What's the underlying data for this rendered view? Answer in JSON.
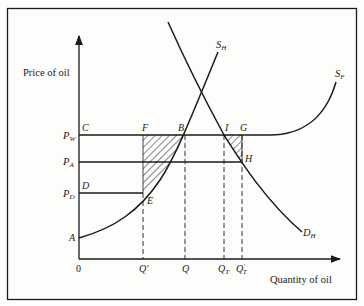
{
  "diagram": {
    "axes": {
      "y_label": "Price of oil",
      "x_label": "Quantity of oil",
      "origin_label": "0"
    },
    "price_levels": {
      "pw": {
        "main": "P",
        "sub": "W"
      },
      "pa": {
        "main": "P",
        "sub": "A"
      },
      "pd": {
        "main": "P",
        "sub": "D"
      }
    },
    "quantity_levels": {
      "q_prime": "Q′",
      "q": "Q",
      "qt": {
        "main": "Q",
        "sub": "T"
      },
      "qt_prime": {
        "main": "Q",
        "sub": "T",
        "prime": "′"
      }
    },
    "points": {
      "a": "A",
      "c": "C",
      "d": "D",
      "e": "E",
      "f": "F",
      "b": "B",
      "i": "I",
      "g": "G",
      "h": "H"
    },
    "curves": {
      "sh": {
        "main": "S",
        "sub": "H"
      },
      "sf": {
        "main": "S",
        "sub": "F"
      },
      "dh": {
        "main": "D",
        "sub": "H"
      }
    },
    "colors": {
      "ink": "#1a1a1a",
      "paper": "#fdfdfb"
    }
  }
}
